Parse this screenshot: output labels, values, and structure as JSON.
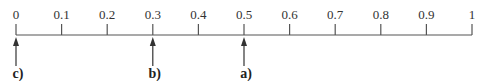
{
  "number_line": {
    "min": 0,
    "max": 1,
    "ticks": [
      {
        "value": 0,
        "label": "0"
      },
      {
        "value": 0.1,
        "label": "0.1"
      },
      {
        "value": 0.2,
        "label": "0.2"
      },
      {
        "value": 0.3,
        "label": "0.3"
      },
      {
        "value": 0.4,
        "label": "0.4"
      },
      {
        "value": 0.5,
        "label": "0.5"
      },
      {
        "value": 0.6,
        "label": "0.6"
      },
      {
        "value": 0.7,
        "label": "0.7"
      },
      {
        "value": 0.8,
        "label": "0.8"
      },
      {
        "value": 0.9,
        "label": "0.9"
      },
      {
        "value": 1,
        "label": "1"
      }
    ],
    "markers": [
      {
        "value": 0,
        "label": "c)"
      },
      {
        "value": 0.3,
        "label": "b)"
      },
      {
        "value": 0.5,
        "label": "a)"
      }
    ],
    "line_color": "#555555"
  }
}
